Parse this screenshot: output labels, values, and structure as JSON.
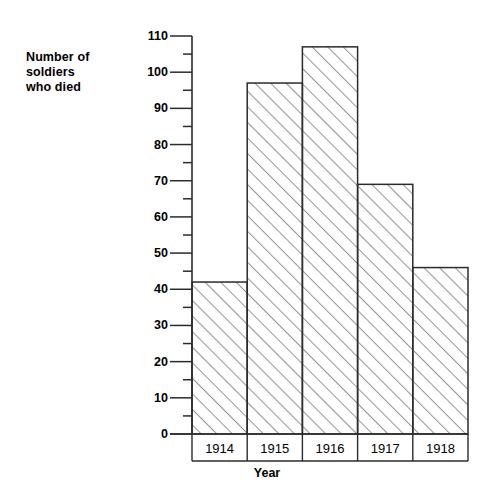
{
  "chart_data": {
    "type": "bar",
    "title": "",
    "subtitle": "",
    "xlabel": "Year",
    "ylabel": "Number of\nsoldiers\nwho died",
    "categories": [
      "1914",
      "1915",
      "1916",
      "1917",
      "1918"
    ],
    "values": [
      42,
      97,
      107,
      69,
      46
    ],
    "series": [
      {
        "name": "Number of soldiers who died",
        "values": [
          42,
          97,
          107,
          69,
          46
        ]
      }
    ],
    "ylim": [
      0,
      110
    ],
    "xlim": [
      0,
      5
    ],
    "y_major_step": 10,
    "y_minor_step": 5,
    "y_tick_labels": [
      "0",
      "10",
      "20",
      "30",
      "40",
      "50",
      "60",
      "70",
      "80",
      "90",
      "100",
      "110"
    ],
    "y_tick_values": [
      0,
      10,
      20,
      30,
      40,
      50,
      60,
      70,
      80,
      90,
      100,
      110
    ],
    "grid": false,
    "legend": null,
    "legend_position": "none",
    "bar_style": {
      "fill": "none",
      "hatch": "diagonal-forward",
      "hatch_color": "#6f6f6f",
      "edge_color": "#2b2b2b",
      "gap": 0
    },
    "axis_color": "#2b2b2b",
    "annotations": []
  },
  "chart": {
    "y_axis_title": "Number of\nsoldiers\nwho died",
    "x_axis_title": "Year"
  }
}
